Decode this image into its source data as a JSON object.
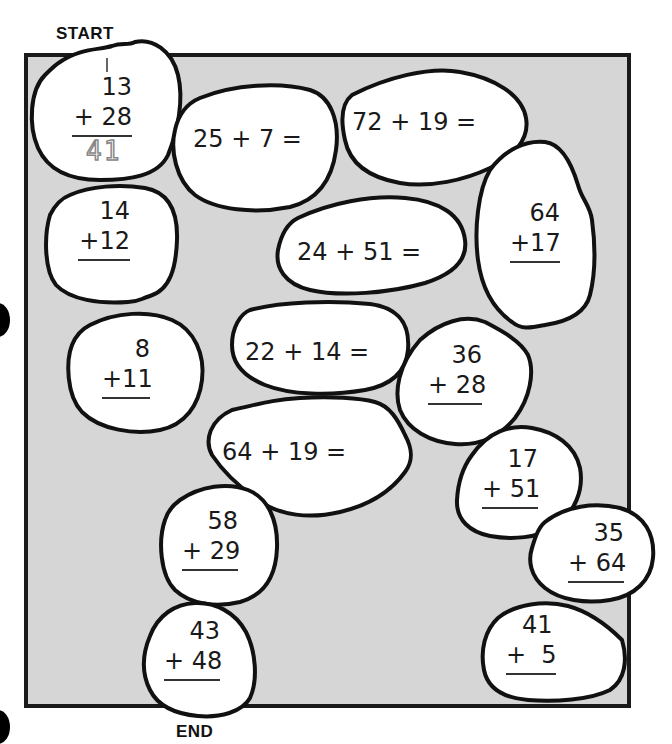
{
  "labels": {
    "start": "START",
    "end": "END"
  },
  "colors": {
    "background": "#ffffff",
    "board_fill": "#d6d6d6",
    "board_border": "#1a1a1a",
    "stone_fill": "#ffffff",
    "stone_border": "#111111",
    "traced_answer": "#888888"
  },
  "stones": [
    {
      "id": "start",
      "type": "vertical",
      "carry": "1",
      "top": "13",
      "bottom": "+ 28",
      "answer": "41",
      "answer_style": "dotted-trace"
    },
    {
      "id": "s2",
      "type": "horizontal",
      "text": "25 + 7 ="
    },
    {
      "id": "s3",
      "type": "horizontal",
      "text": "72 + 19 ="
    },
    {
      "id": "s4",
      "type": "vertical",
      "top": "14",
      "bottom": "+12"
    },
    {
      "id": "s5",
      "type": "horizontal",
      "text": "24 + 51 ="
    },
    {
      "id": "s6",
      "type": "vertical",
      "top": "64",
      "bottom": "+17"
    },
    {
      "id": "s7",
      "type": "vertical",
      "top": "8",
      "bottom": "+11"
    },
    {
      "id": "s8",
      "type": "horizontal",
      "text": "22 + 14 ="
    },
    {
      "id": "s9",
      "type": "vertical",
      "top": "36",
      "bottom": "+ 28"
    },
    {
      "id": "s10",
      "type": "horizontal",
      "text": "64 + 19 ="
    },
    {
      "id": "s11",
      "type": "vertical",
      "top": "17",
      "bottom": "+ 51"
    },
    {
      "id": "s12",
      "type": "vertical",
      "top": "58",
      "bottom": "+ 29"
    },
    {
      "id": "s13",
      "type": "vertical",
      "top": "35",
      "bottom": "+ 64"
    },
    {
      "id": "end",
      "type": "vertical",
      "top": "43",
      "bottom": "+ 48"
    },
    {
      "id": "s15",
      "type": "vertical",
      "top": "41",
      "bottom": "+  5"
    }
  ]
}
